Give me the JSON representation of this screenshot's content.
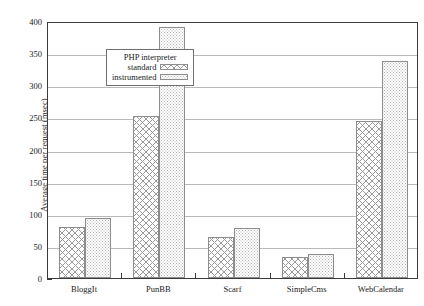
{
  "chart_data": {
    "type": "bar",
    "title": "",
    "xlabel": "",
    "ylabel": "Average time per request (msec)",
    "categories": [
      "BloggIt",
      "PunBB",
      "Scarf",
      "SimpleCms",
      "WebCalendar"
    ],
    "series": [
      {
        "name": "standard",
        "values": [
          80,
          252,
          64,
          33,
          244
        ]
      },
      {
        "name": "instrumented",
        "values": [
          93,
          390,
          78,
          38,
          338
        ]
      }
    ],
    "ylim": [
      0,
      400
    ],
    "yticks": [
      0,
      50,
      100,
      150,
      200,
      250,
      300,
      350,
      400
    ],
    "ytick_labels": [
      "0",
      "50",
      "100",
      "150",
      "200",
      "250",
      "300",
      "350",
      "400"
    ],
    "grid": true,
    "legend": {
      "position": "upper-left-inside",
      "title": "PHP interpreter",
      "entries": [
        {
          "label": "standard",
          "pattern": "crosshatch"
        },
        {
          "label": "instrumented",
          "pattern": "stipple"
        }
      ]
    }
  }
}
